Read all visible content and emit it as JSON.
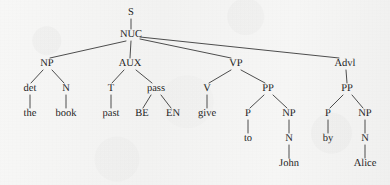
{
  "figure": {
    "kind": "syntax-tree",
    "sentence": "the book past BE EN give to John by Alice",
    "ink_color": "#1c1c1c",
    "line_color": "#3a3a3a",
    "background_color": "#f5f5f4"
  },
  "nodes": {
    "s": {
      "label": "S",
      "x": 131,
      "y": 13,
      "type": "category"
    },
    "nuc": {
      "label": "NUC",
      "x": 131,
      "y": 35,
      "type": "category"
    },
    "np_subj": {
      "label": "NP",
      "x": 47,
      "y": 64,
      "type": "category"
    },
    "aux": {
      "label": "AUX",
      "x": 130,
      "y": 64,
      "type": "category"
    },
    "vp": {
      "label": "VP",
      "x": 236,
      "y": 64,
      "type": "category"
    },
    "advl": {
      "label": "Advl",
      "x": 345,
      "y": 64,
      "type": "category"
    },
    "det": {
      "label": "det",
      "x": 30,
      "y": 89,
      "type": "category"
    },
    "n_subj": {
      "label": "N",
      "x": 66,
      "y": 89,
      "type": "category"
    },
    "t": {
      "label": "T",
      "x": 111,
      "y": 89,
      "type": "category"
    },
    "pass": {
      "label": "pass",
      "x": 156,
      "y": 89,
      "type": "category"
    },
    "v": {
      "label": "V",
      "x": 207,
      "y": 89,
      "type": "category"
    },
    "pp_vp": {
      "label": "PP",
      "x": 268,
      "y": 89,
      "type": "category"
    },
    "pp_advl": {
      "label": "PP",
      "x": 347,
      "y": 89,
      "type": "category"
    },
    "p_to": {
      "label": "P",
      "x": 248,
      "y": 114,
      "type": "category"
    },
    "np_to": {
      "label": "NP",
      "x": 289,
      "y": 114,
      "type": "category"
    },
    "p_by": {
      "label": "P",
      "x": 328,
      "y": 114,
      "type": "category"
    },
    "np_by": {
      "label": "NP",
      "x": 365,
      "y": 114,
      "type": "category"
    },
    "n_john": {
      "label": "N",
      "x": 289,
      "y": 139,
      "type": "category"
    },
    "n_alice": {
      "label": "N",
      "x": 365,
      "y": 139,
      "type": "category"
    },
    "the": {
      "label": "the",
      "x": 30,
      "y": 114,
      "type": "leaf"
    },
    "book": {
      "label": "book",
      "x": 66,
      "y": 114,
      "type": "leaf"
    },
    "past": {
      "label": "past",
      "x": 111,
      "y": 114,
      "type": "leaf"
    },
    "be": {
      "label": "BE",
      "x": 142,
      "y": 114,
      "type": "leaf"
    },
    "en": {
      "label": "EN",
      "x": 173,
      "y": 114,
      "type": "leaf"
    },
    "give": {
      "label": "give",
      "x": 207,
      "y": 114,
      "type": "leaf"
    },
    "to": {
      "label": "to",
      "x": 248,
      "y": 139,
      "type": "leaf"
    },
    "by": {
      "label": "by",
      "x": 328,
      "y": 139,
      "type": "leaf"
    },
    "john": {
      "label": "John",
      "x": 289,
      "y": 164,
      "type": "leaf"
    },
    "alice": {
      "label": "Alice",
      "x": 365,
      "y": 164,
      "type": "leaf"
    }
  },
  "edges": [
    {
      "from": "s",
      "to": "nuc",
      "x1": 131,
      "y1": 19,
      "x2": 131,
      "y2": 29
    },
    {
      "from": "nuc",
      "to": "np_subj",
      "x1": 126,
      "y1": 41,
      "x2": 50,
      "y2": 58
    },
    {
      "from": "nuc",
      "to": "aux",
      "x1": 131,
      "y1": 41,
      "x2": 130,
      "y2": 58
    },
    {
      "from": "nuc",
      "to": "vp",
      "x1": 140,
      "y1": 39,
      "x2": 231,
      "y2": 58
    },
    {
      "from": "nuc",
      "to": "advl",
      "x1": 140,
      "y1": 37,
      "x2": 339,
      "y2": 58
    },
    {
      "from": "np_subj",
      "to": "det",
      "x1": 43,
      "y1": 70,
      "x2": 31,
      "y2": 83
    },
    {
      "from": "np_subj",
      "to": "n_subj",
      "x1": 52,
      "y1": 70,
      "x2": 64,
      "y2": 83
    },
    {
      "from": "aux",
      "to": "t",
      "x1": 124,
      "y1": 70,
      "x2": 112,
      "y2": 83
    },
    {
      "from": "aux",
      "to": "pass",
      "x1": 136,
      "y1": 70,
      "x2": 152,
      "y2": 83
    },
    {
      "from": "vp",
      "to": "v",
      "x1": 231,
      "y1": 70,
      "x2": 209,
      "y2": 83
    },
    {
      "from": "vp",
      "to": "pp_vp",
      "x1": 241,
      "y1": 70,
      "x2": 265,
      "y2": 83
    },
    {
      "from": "advl",
      "to": "pp_advl",
      "x1": 346,
      "y1": 70,
      "x2": 347,
      "y2": 83
    },
    {
      "from": "det",
      "to": "the",
      "x1": 30,
      "y1": 95,
      "x2": 30,
      "y2": 108
    },
    {
      "from": "n_subj",
      "to": "book",
      "x1": 66,
      "y1": 95,
      "x2": 66,
      "y2": 108
    },
    {
      "from": "t",
      "to": "past",
      "x1": 111,
      "y1": 95,
      "x2": 111,
      "y2": 108
    },
    {
      "from": "pass",
      "to": "be",
      "x1": 151,
      "y1": 95,
      "x2": 143,
      "y2": 108
    },
    {
      "from": "pass",
      "to": "en",
      "x1": 161,
      "y1": 95,
      "x2": 171,
      "y2": 108
    },
    {
      "from": "v",
      "to": "give",
      "x1": 207,
      "y1": 95,
      "x2": 207,
      "y2": 108
    },
    {
      "from": "pp_vp",
      "to": "p_to",
      "x1": 264,
      "y1": 95,
      "x2": 250,
      "y2": 108
    },
    {
      "from": "pp_vp",
      "to": "np_to",
      "x1": 273,
      "y1": 95,
      "x2": 287,
      "y2": 108
    },
    {
      "from": "pp_advl",
      "to": "p_by",
      "x1": 343,
      "y1": 95,
      "x2": 330,
      "y2": 108
    },
    {
      "from": "pp_advl",
      "to": "np_by",
      "x1": 352,
      "y1": 95,
      "x2": 363,
      "y2": 108
    },
    {
      "from": "p_to",
      "to": "to",
      "x1": 248,
      "y1": 120,
      "x2": 248,
      "y2": 133
    },
    {
      "from": "np_to",
      "to": "n_john",
      "x1": 289,
      "y1": 120,
      "x2": 289,
      "y2": 133
    },
    {
      "from": "p_by",
      "to": "by",
      "x1": 328,
      "y1": 120,
      "x2": 328,
      "y2": 133
    },
    {
      "from": "np_by",
      "to": "n_alice",
      "x1": 365,
      "y1": 120,
      "x2": 365,
      "y2": 133
    },
    {
      "from": "n_john",
      "to": "john",
      "x1": 289,
      "y1": 145,
      "x2": 289,
      "y2": 158
    },
    {
      "from": "n_alice",
      "to": "alice",
      "x1": 365,
      "y1": 145,
      "x2": 365,
      "y2": 158
    }
  ]
}
